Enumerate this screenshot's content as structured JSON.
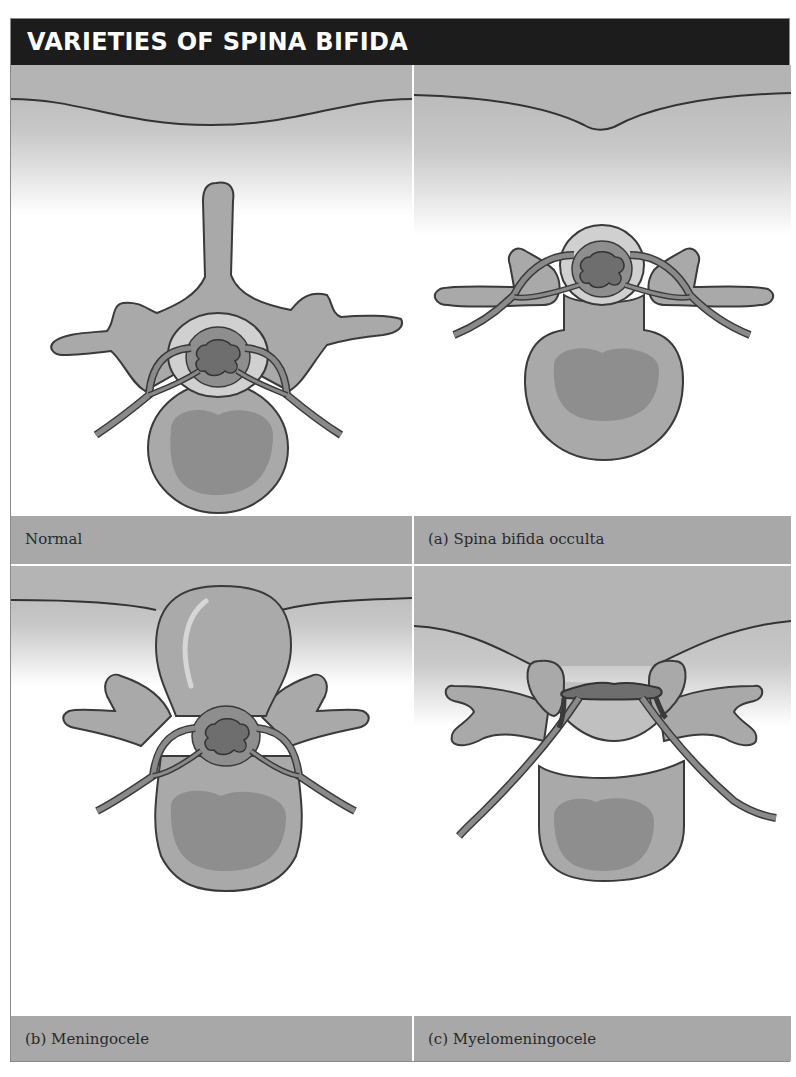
{
  "figure": {
    "title": "VARIETIES OF SPINA BIFIDA",
    "colors": {
      "header_bg": "#1c1c1c",
      "header_text": "#ffffff",
      "caption_bg": "#a8a8a8",
      "skin_bg": "#b4b4b4",
      "bone_fill": "#a9a9a9",
      "bone_inner": "#8e8e8e",
      "cord_fill": "#6e6e6e",
      "outline": "#3a3a3a"
    },
    "panels": [
      {
        "id": "normal",
        "caption": "Normal",
        "illustration": "normal-vertebra-icon"
      },
      {
        "id": "occulta",
        "caption": "(a) Spina bifida occulta",
        "illustration": "spina-bifida-occulta-icon"
      },
      {
        "id": "meningocele",
        "caption": "(b) Meningocele",
        "illustration": "meningocele-icon"
      },
      {
        "id": "myelomeningocele",
        "caption": "(c) Myelomeningocele",
        "illustration": "myelomeningocele-icon"
      }
    ]
  }
}
